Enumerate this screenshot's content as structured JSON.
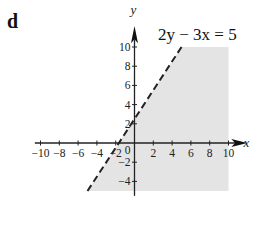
{
  "part_label": "d",
  "chart_data": {
    "type": "line",
    "title": "",
    "annotation": "2y − 3x = 5",
    "xlabel": "x",
    "ylabel": "y",
    "xlim": [
      -10,
      10
    ],
    "ylim": [
      -5,
      10
    ],
    "x_ticks": [
      -10,
      -8,
      -6,
      -4,
      -2,
      0,
      2,
      4,
      6,
      8,
      10
    ],
    "y_ticks": [
      -4,
      -2,
      2,
      4,
      6,
      8,
      10
    ],
    "x_tick_labels": [
      "−10",
      "−8",
      "−6",
      "−4",
      "−2",
      "0",
      "2",
      "4",
      "6",
      "8",
      "10"
    ],
    "y_tick_labels": [
      "−4",
      "−2",
      "2",
      "4",
      "6",
      "8",
      "10"
    ],
    "grid": false,
    "series": [
      {
        "name": "2y − 3x = 5",
        "style": "dashed",
        "x": [
          -5,
          5
        ],
        "y": [
          -5,
          10
        ]
      }
    ],
    "shaded_region": {
      "description": "region 2y − 3x < 5 (right of / below the dashed line), bounded by x ≤ 10 and −5 ≤ y ≤ 10",
      "polygon": [
        [
          -5,
          -5
        ],
        [
          5,
          10
        ],
        [
          10,
          10
        ],
        [
          10,
          -5
        ]
      ],
      "color": "#e4e4e4"
    }
  }
}
